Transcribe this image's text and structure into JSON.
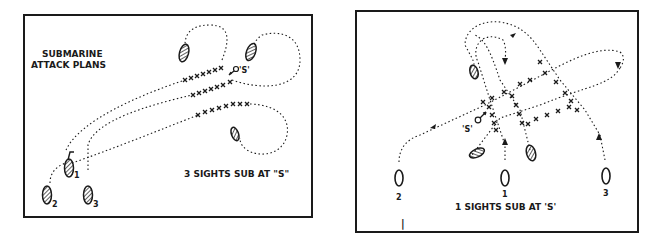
{
  "left_panel": {
    "title_line1": "SUBMARINE",
    "title_line2": "ATTACK PLANS",
    "caption": "3 SIGHTS SUB AT \"S\"",
    "sub_label": "'S'",
    "ship_labels": [
      "1",
      "2",
      "3"
    ]
  },
  "right_panel": {
    "caption": "1 SIGHTS SUB AT 'S'",
    "sub_label": "'S'",
    "ship_labels": [
      "2",
      "1",
      "3"
    ],
    "tick_mark": "|"
  },
  "colors": {
    "ink": "#1a1a1a",
    "background": "#ffffff"
  }
}
